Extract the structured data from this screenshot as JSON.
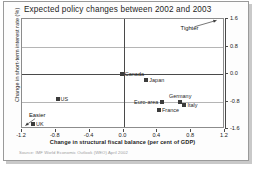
{
  "page": {
    "title": "Expected policy changes between 2002 and 2003",
    "source_note": "Source: IMF World Economic Outlook (WEO) April 2002"
  },
  "chart_data": {
    "type": "scatter",
    "title": "Expected policy changes between 2002 and 2003",
    "xlabel": "Change in structural fiscal balance (per cent of GDP)",
    "ylabel": "Change in short-term interest rate (%)",
    "xlim": [
      -1.2,
      1.2
    ],
    "ylim": [
      -1.6,
      1.6
    ],
    "xticks": [
      "-1.2",
      "-0.8",
      "-0.4",
      "0.0",
      "0.4",
      "0.8",
      "1.2"
    ],
    "xtick_values": [
      -1.2,
      -0.8,
      -0.4,
      0.0,
      0.4,
      0.8,
      1.2
    ],
    "yticks": [
      "1.6",
      "0.8",
      "0.0",
      "-0.8",
      "-1.6"
    ],
    "ytick_values": [
      1.6,
      0.8,
      0.0,
      -0.8,
      -1.6
    ],
    "grid": true,
    "legend": "none",
    "y_axis_position": "right",
    "points": [
      {
        "name": "Canada",
        "x": -0.02,
        "y": 0.0,
        "label_side": "right"
      },
      {
        "name": "Japan",
        "x": 0.27,
        "y": -0.18,
        "label_side": "right"
      },
      {
        "name": "Euro-area",
        "x": 0.46,
        "y": -0.8,
        "label_side": "left"
      },
      {
        "name": "Germany",
        "x": 0.67,
        "y": -0.8,
        "label_side": "above"
      },
      {
        "name": "Italy",
        "x": 0.72,
        "y": -0.9,
        "label_side": "right"
      },
      {
        "name": "France",
        "x": 0.42,
        "y": -1.05,
        "label_side": "right"
      },
      {
        "name": "US",
        "x": -0.78,
        "y": -0.72,
        "label_side": "right"
      },
      {
        "name": "UK",
        "x": -1.07,
        "y": -1.44,
        "label_side": "right"
      }
    ],
    "annotations": [
      {
        "name": "Tighter",
        "text": "Tighter",
        "x": 0.78,
        "y": 1.3,
        "arrow_to_x": 1.1,
        "arrow_to_y": 1.56
      },
      {
        "name": "Easier",
        "text": "Easier",
        "x": -1.02,
        "y": -1.22,
        "arrow_to_x": -1.16,
        "arrow_to_y": -1.5
      }
    ]
  },
  "colors": {
    "marker": "#3c3c3c",
    "axis": "#4a4a4a",
    "grid": "#b5b5b5",
    "frame": "#8c8c8c",
    "text": "#1d1d1d",
    "source_text": "#9b9b9b",
    "background": "#ffffff"
  }
}
